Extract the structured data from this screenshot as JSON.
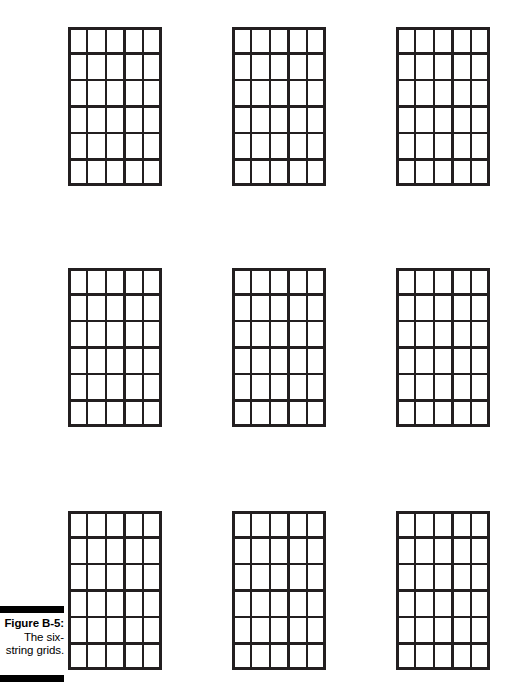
{
  "figure": {
    "caption_title": "Figure B-5:",
    "caption_lines": [
      "The six-",
      "string grids."
    ],
    "background_color": "#ffffff",
    "line_color": "#231f20",
    "rule_color": "#000000"
  },
  "grid_spec": {
    "strings": 6,
    "frets": 6,
    "columns": 5,
    "rows": 6,
    "description": "blank six-string guitar chord grid"
  },
  "layout": {
    "rows": 3,
    "columns": 3,
    "total_grids": 9
  },
  "grids": [
    {
      "id": "grid-1",
      "row": 1,
      "col": 1,
      "x": 68,
      "y": 27,
      "width": 94,
      "height": 159
    },
    {
      "id": "grid-2",
      "row": 1,
      "col": 2,
      "x": 232,
      "y": 27,
      "width": 94,
      "height": 159
    },
    {
      "id": "grid-3",
      "row": 1,
      "col": 3,
      "x": 396,
      "y": 27,
      "width": 94,
      "height": 159
    },
    {
      "id": "grid-4",
      "row": 2,
      "col": 1,
      "x": 68,
      "y": 268,
      "width": 94,
      "height": 159
    },
    {
      "id": "grid-5",
      "row": 2,
      "col": 2,
      "x": 232,
      "y": 268,
      "width": 94,
      "height": 159
    },
    {
      "id": "grid-6",
      "row": 2,
      "col": 3,
      "x": 396,
      "y": 268,
      "width": 94,
      "height": 159
    },
    {
      "id": "grid-7",
      "row": 3,
      "col": 1,
      "x": 68,
      "y": 511,
      "width": 94,
      "height": 159
    },
    {
      "id": "grid-8",
      "row": 3,
      "col": 2,
      "x": 232,
      "y": 511,
      "width": 94,
      "height": 159
    },
    {
      "id": "grid-9",
      "row": 3,
      "col": 3,
      "x": 396,
      "y": 511,
      "width": 94,
      "height": 159
    }
  ]
}
